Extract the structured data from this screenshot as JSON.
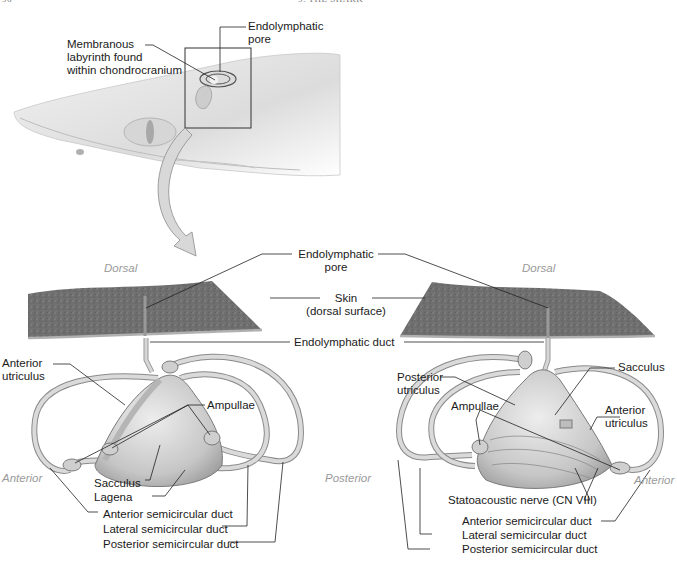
{
  "header": {
    "page_number": "96",
    "chapter": "9: THE SHARK"
  },
  "overview": {
    "labels": {
      "membranous_labyrinth": [
        "Membranous",
        "labyrinth found",
        "within chondrocranium"
      ],
      "endolymphatic_pore": [
        "Endolymphatic",
        "pore"
      ]
    }
  },
  "detail": {
    "shared_labels": {
      "endolymphatic_pore": [
        "Endolymphatic",
        "pore"
      ],
      "skin": [
        "Skin",
        "(dorsal surface)"
      ],
      "endolymphatic_duct": "Endolymphatic duct"
    },
    "left_view": {
      "orientation": {
        "top": "Dorsal",
        "left": "Anterior",
        "right": "Posterior"
      },
      "labels": {
        "anterior_utriculus": [
          "Anterior",
          "utriculus"
        ],
        "ampullae": "Ampullae",
        "sacculus": "Sacculus",
        "lagena": "Lagena",
        "anterior_semicircular_duct": "Anterior semicircular duct",
        "lateral_semicircular_duct": "Lateral semicircular duct",
        "posterior_semicircular_duct": "Posterior semicircular duct"
      }
    },
    "right_view": {
      "orientation": {
        "top": "Dorsal",
        "right": "Anterior"
      },
      "labels": {
        "posterior_utriculus": [
          "Posterior",
          "utriculus"
        ],
        "sacculus": "Sacculus",
        "ampullae": "Ampullae",
        "anterior_utriculus": [
          "Anterior",
          "utriculus"
        ],
        "statoacoustic_nerve": "Statoacoustic nerve (CN VIII)",
        "anterior_semicircular_duct": "Anterior semicircular duct",
        "lateral_semicircular_duct": "Lateral semicircular duct",
        "posterior_semicircular_duct": "Posterior semicircular duct"
      }
    }
  },
  "colors": {
    "skin_texture": "#6e6e6e",
    "labyrinth_fill": "#cfcfcf",
    "labyrinth_stroke": "#7a7a7a",
    "shark_body": "#e6e6e6",
    "leader_line": "#222222",
    "orientation_text": "#9a9a9a"
  }
}
